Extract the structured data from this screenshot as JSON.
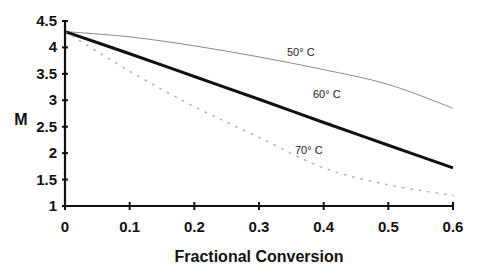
{
  "chart_data": {
    "type": "line",
    "title": "",
    "xlabel": "Fractional Conversion",
    "ylabel": "M",
    "xlim": [
      0,
      0.6
    ],
    "ylim": [
      1,
      4.5
    ],
    "x_ticks": [
      "0",
      "0.1",
      "0.2",
      "0.3",
      "0.4",
      "0.5",
      "0.6"
    ],
    "y_ticks": [
      "1",
      "1.5",
      "2",
      "2.5",
      "3",
      "3.5",
      "4",
      "4.5"
    ],
    "grid": false,
    "legend": "inline labels on curves",
    "x": [
      0,
      0.1,
      0.2,
      0.3,
      0.4,
      0.5,
      0.6
    ],
    "series": [
      {
        "name": "50° C",
        "label": "50° C",
        "style": "thin-solid",
        "color": "#888888",
        "values": [
          4.3,
          4.2,
          4.03,
          3.82,
          3.58,
          3.3,
          2.85
        ]
      },
      {
        "name": "60° C",
        "label": "60° C",
        "style": "thick-solid",
        "color": "#111111",
        "values": [
          4.3,
          3.88,
          3.45,
          3.02,
          2.58,
          2.15,
          1.72
        ]
      },
      {
        "name": "70° C",
        "label": "70° C",
        "style": "dotted",
        "color": "#aaaaaa",
        "values": [
          4.3,
          3.55,
          2.88,
          2.3,
          1.72,
          1.4,
          1.2
        ]
      }
    ]
  }
}
